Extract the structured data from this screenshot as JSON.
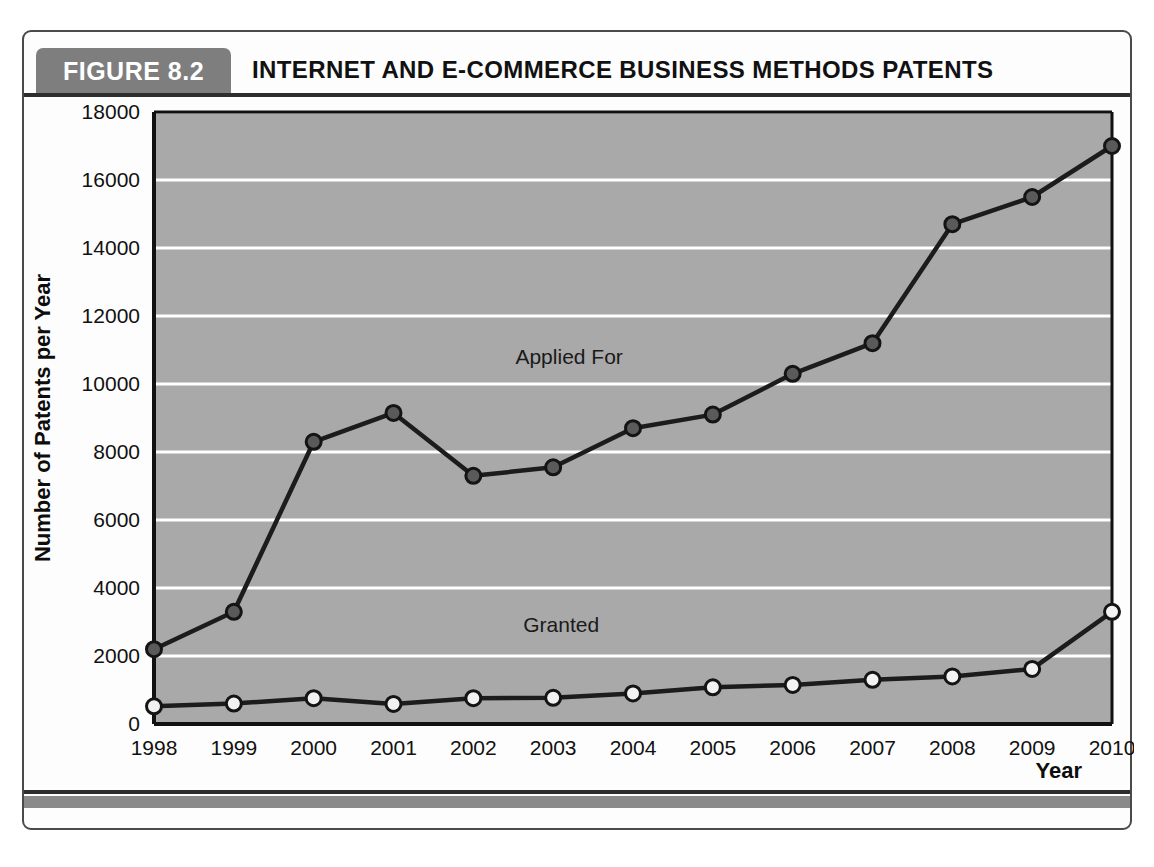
{
  "figure": {
    "tag": "FIGURE 8.2",
    "title": "INTERNET AND E-COMMERCE BUSINESS METHODS PATENTS",
    "tag_bg_color": "#7e7e7e",
    "tag_text_color": "#ffffff",
    "rule_color": "#2e2e2e",
    "footer_bar_color": "#8a8a8a"
  },
  "chart_data": {
    "type": "line",
    "title": "INTERNET AND E-COMMERCE BUSINESS METHODS PATENTS",
    "xlabel": "Year",
    "ylabel": "Number of Patents per Year",
    "categories": [
      "1998",
      "1999",
      "2000",
      "2001",
      "2002",
      "2003",
      "2004",
      "2005",
      "2006",
      "2007",
      "2008",
      "2009",
      "2010"
    ],
    "x": [
      1998,
      1999,
      2000,
      2001,
      2002,
      2003,
      2004,
      2005,
      2006,
      2007,
      2008,
      2009,
      2010
    ],
    "xlim": [
      1998,
      2010
    ],
    "ylim": [
      0,
      18000
    ],
    "yticks": [
      0,
      2000,
      4000,
      6000,
      8000,
      10000,
      12000,
      14000,
      16000,
      18000
    ],
    "ytick_labels": [
      "0",
      "2000",
      "4000",
      "6000",
      "8000",
      "10000",
      "12000",
      "14000",
      "16000",
      "18000"
    ],
    "grid": "horizontal-white",
    "plot_background": "#a9a9a9",
    "gridline_color": "#ffffff",
    "legend": "inline-annotations",
    "series": [
      {
        "name": "Applied For",
        "label": "Applied For",
        "color": "#1c1c1c",
        "marker": "circle-dark",
        "marker_fill": "#5a5a5a",
        "values": [
          2200,
          3300,
          8300,
          9150,
          7300,
          7550,
          8700,
          9100,
          10300,
          11200,
          14700,
          15500,
          17000
        ]
      },
      {
        "name": "Granted",
        "label": "Granted",
        "color": "#1c1c1c",
        "marker": "circle-light",
        "marker_fill": "#f2f2f2",
        "values": [
          520,
          600,
          760,
          590,
          760,
          770,
          900,
          1080,
          1150,
          1300,
          1400,
          1620,
          3300
        ]
      }
    ],
    "annotations": [
      {
        "text": "Applied For",
        "x": 2003.2,
        "y": 10600
      },
      {
        "text": "Granted",
        "x": 2003.1,
        "y": 2700
      }
    ]
  }
}
